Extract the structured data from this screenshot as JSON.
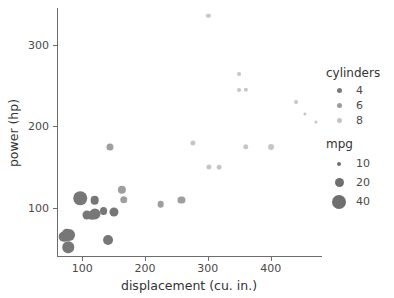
{
  "chart_data": {
    "type": "scatter",
    "title": "",
    "xlabel": "displacement (cu. in.)",
    "ylabel": "power (hp)",
    "xlim": [
      60,
      480
    ],
    "ylim": [
      40,
      345
    ],
    "xticks": [
      100,
      200,
      300,
      400
    ],
    "yticks": [
      100,
      200,
      300
    ],
    "grid": false,
    "legend_position": "right",
    "encodings": {
      "x": "displacement",
      "y": "power",
      "color": "cylinders",
      "size": "mpg"
    },
    "colors": {
      "cylinders_4": "#777777",
      "cylinders_6": "#9e9e9e",
      "cylinders_8": "#c6c6c6",
      "axis": "#6d6d6d",
      "text": "#3a3a3a",
      "background": "#ffffff"
    },
    "points": [
      {
        "displacement": 71,
        "power": 65,
        "cylinders": 4,
        "mpg": 31
      },
      {
        "displacement": 76,
        "power": 68,
        "cylinders": 4,
        "mpg": 30
      },
      {
        "displacement": 79,
        "power": 67,
        "cylinders": 4,
        "mpg": 34
      },
      {
        "displacement": 78,
        "power": 52,
        "cylinders": 4,
        "mpg": 33
      },
      {
        "displacement": 97,
        "power": 112,
        "cylinders": 4,
        "mpg": 38
      },
      {
        "displacement": 108,
        "power": 92,
        "cylinders": 4,
        "mpg": 27
      },
      {
        "displacement": 116,
        "power": 90,
        "cylinders": 4,
        "mpg": 25
      },
      {
        "displacement": 120,
        "power": 110,
        "cylinders": 4,
        "mpg": 26
      },
      {
        "displacement": 121,
        "power": 93,
        "cylinders": 4,
        "mpg": 32
      },
      {
        "displacement": 134,
        "power": 96,
        "cylinders": 4,
        "mpg": 24
      },
      {
        "displacement": 141,
        "power": 61,
        "cylinders": 4,
        "mpg": 29
      },
      {
        "displacement": 144,
        "power": 175,
        "cylinders": 6,
        "mpg": 22
      },
      {
        "displacement": 151,
        "power": 95,
        "cylinders": 4,
        "mpg": 27
      },
      {
        "displacement": 163,
        "power": 122,
        "cylinders": 6,
        "mpg": 25
      },
      {
        "displacement": 166,
        "power": 110,
        "cylinders": 6,
        "mpg": 23
      },
      {
        "displacement": 225,
        "power": 105,
        "cylinders": 6,
        "mpg": 21
      },
      {
        "displacement": 258,
        "power": 110,
        "cylinders": 6,
        "mpg": 22
      },
      {
        "displacement": 276,
        "power": 180,
        "cylinders": 8,
        "mpg": 17
      },
      {
        "displacement": 302,
        "power": 150,
        "cylinders": 8,
        "mpg": 17
      },
      {
        "displacement": 301,
        "power": 335,
        "cylinders": 8,
        "mpg": 15
      },
      {
        "displacement": 318,
        "power": 150,
        "cylinders": 8,
        "mpg": 16
      },
      {
        "displacement": 350,
        "power": 245,
        "cylinders": 8,
        "mpg": 14
      },
      {
        "displacement": 350,
        "power": 264,
        "cylinders": 8,
        "mpg": 14
      },
      {
        "displacement": 360,
        "power": 245,
        "cylinders": 8,
        "mpg": 15
      },
      {
        "displacement": 360,
        "power": 175,
        "cylinders": 8,
        "mpg": 18
      },
      {
        "displacement": 400,
        "power": 175,
        "cylinders": 8,
        "mpg": 19
      },
      {
        "displacement": 440,
        "power": 230,
        "cylinders": 8,
        "mpg": 14
      },
      {
        "displacement": 455,
        "power": 215,
        "cylinders": 8,
        "mpg": 12
      },
      {
        "displacement": 472,
        "power": 205,
        "cylinders": 8,
        "mpg": 11
      }
    ]
  },
  "axes": {
    "x": {
      "title": "displacement (cu. in.)",
      "ticks": [
        {
          "label": "100",
          "value": 100
        },
        {
          "label": "200",
          "value": 200
        },
        {
          "label": "300",
          "value": 300
        },
        {
          "label": "400",
          "value": 400
        }
      ]
    },
    "y": {
      "title": "power (hp)",
      "ticks": [
        {
          "label": "100",
          "value": 100
        },
        {
          "label": "200",
          "value": 200
        },
        {
          "label": "300",
          "value": 300
        }
      ]
    }
  },
  "legend": {
    "cylinders": {
      "title": "cylinders",
      "entries": [
        {
          "label": "4",
          "color": "#7a7a7a",
          "size": 5
        },
        {
          "label": "6",
          "color": "#9b9b9b",
          "size": 5
        },
        {
          "label": "8",
          "color": "#c4c4c4",
          "size": 5
        }
      ]
    },
    "mpg": {
      "title": "mpg",
      "entries": [
        {
          "label": "10",
          "color": "#6f6f6f",
          "size": 4
        },
        {
          "label": "20",
          "color": "#6f6f6f",
          "size": 9
        },
        {
          "label": "40",
          "color": "#6f6f6f",
          "size": 14
        }
      ]
    }
  }
}
